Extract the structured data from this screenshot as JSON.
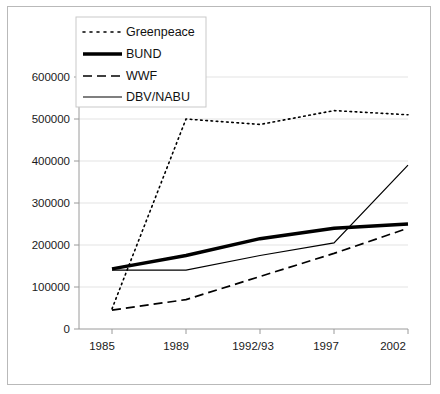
{
  "chart_data": {
    "type": "line",
    "title": "",
    "subtitle": "",
    "xlabel": "",
    "ylabel": "",
    "categories": [
      "1985",
      "1989",
      "1992/93",
      "1997",
      "2002"
    ],
    "yticks": [
      "0",
      "100000",
      "200000",
      "300000",
      "400000",
      "500000",
      "600000"
    ],
    "ylim": [
      0,
      600000
    ],
    "ytick_step": 100000,
    "grid": true,
    "legend_position": "top-left-inside",
    "series": [
      {
        "name": "Greenpeace",
        "style": "dotted",
        "color": "#000000",
        "values": [
          48000,
          500000,
          487000,
          520000,
          510000
        ]
      },
      {
        "name": "BUND",
        "style": "solid-thick",
        "color": "#000000",
        "values": [
          143000,
          175000,
          215000,
          240000,
          250000
        ]
      },
      {
        "name": "WWF",
        "style": "dashed",
        "color": "#000000",
        "values": [
          45000,
          70000,
          125000,
          180000,
          240000
        ]
      },
      {
        "name": "DBV/NABU",
        "style": "solid-thin",
        "color": "#000000",
        "values": [
          140000,
          140000,
          175000,
          205000,
          390000
        ]
      }
    ]
  },
  "legend": {
    "items": [
      {
        "label": "Greenpeace",
        "swatch": "dotted-line-swatch"
      },
      {
        "label": "BUND",
        "swatch": "thick-solid-line-swatch"
      },
      {
        "label": "WWF",
        "swatch": "dashed-line-swatch"
      },
      {
        "label": "DBV/NABU",
        "swatch": "thin-solid-line-swatch"
      }
    ]
  }
}
